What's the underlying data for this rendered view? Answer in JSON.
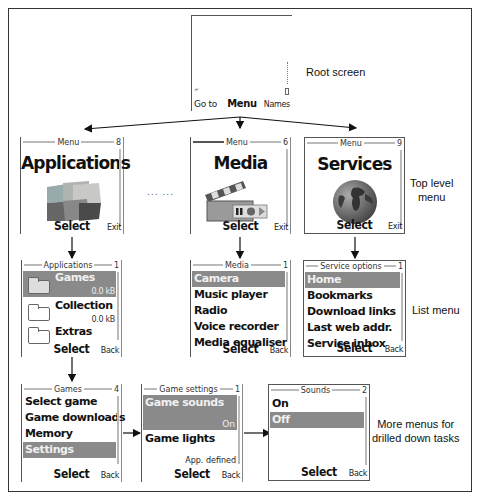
{
  "diagram": {
    "labels": {
      "root": "Root screen",
      "top_level": "Top level\nmenu",
      "list_menu": "List menu",
      "drilled": "More menus for\ndrilled down tasks",
      "ellipsis": "... ..."
    }
  },
  "root_screen": {
    "left_softkey": "Go to",
    "center_softkey": "Menu",
    "right_softkey": "Names",
    "signal_icon": "antenna-icon",
    "battery_icon": "battery-icon"
  },
  "top_level": [
    {
      "title": "Menu",
      "count": "8",
      "heading": "Applications",
      "icon": "cubes-icon",
      "select": "Select",
      "right": "Exit"
    },
    {
      "title": "Menu",
      "count": "6",
      "heading": "Media",
      "icon": "clapperboard-icon",
      "select": "Select",
      "right": "Exit"
    },
    {
      "title": "Menu",
      "count": "9",
      "heading": "Services",
      "icon": "globe-icon",
      "select": "Select",
      "right": "Exit"
    }
  ],
  "list_menus": {
    "applications": {
      "title": "Applications",
      "count": "1",
      "items": [
        {
          "label": "Games",
          "size": "0.0 kB",
          "selected": true
        },
        {
          "label": "Collection",
          "size": "0.0 kB",
          "selected": false
        },
        {
          "label": "Extras",
          "size": "",
          "selected": false
        }
      ],
      "select": "Select",
      "right": "Back"
    },
    "media": {
      "title": "Media",
      "count": "1",
      "items": [
        "Camera",
        "Music player",
        "Radio",
        "Voice recorder",
        "Media equaliser"
      ],
      "selected_index": 0,
      "select": "Select",
      "right": "Back"
    },
    "services": {
      "title": "Service options",
      "count": "1",
      "items": [
        "Home",
        "Bookmarks",
        "Download links",
        "Last web addr.",
        "Service inbox"
      ],
      "selected_index": 0,
      "select": "Select",
      "right": "Back"
    }
  },
  "drilled": {
    "games": {
      "title": "Games",
      "count": "4",
      "items": [
        "Select game",
        "Game downloads",
        "Memory",
        "Settings"
      ],
      "selected_index": 3,
      "select": "Select",
      "right": "Back"
    },
    "game_settings": {
      "title": "Game settings",
      "count": "1",
      "items": [
        {
          "label": "Game sounds",
          "value": "On",
          "selected": true
        },
        {
          "label": "Game lights",
          "value": "App. defined",
          "selected": false
        }
      ],
      "select": "Select",
      "right": "Back"
    },
    "sounds": {
      "title": "Sounds",
      "count": "2",
      "items": [
        "On",
        "Off"
      ],
      "selected_index": 1,
      "select": "Select",
      "right": "Back"
    }
  }
}
